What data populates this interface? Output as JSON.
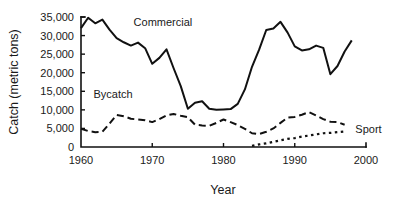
{
  "chart_data": {
    "type": "line",
    "title": "",
    "xlabel": "Year",
    "ylabel": "Catch (metric tons)",
    "xlim": [
      1960,
      2000
    ],
    "ylim": [
      0,
      35000
    ],
    "grid": false,
    "legend_position": "inline-annotations",
    "xticks": [
      1960,
      1970,
      1980,
      1990,
      2000
    ],
    "xtick_labels": [
      "1960",
      "1970",
      "1980",
      "1990",
      "2000"
    ],
    "yticks": [
      0,
      5000,
      10000,
      15000,
      20000,
      25000,
      30000,
      35000
    ],
    "ytick_labels": [
      "0",
      "5,000",
      "10,000",
      "15,000",
      "20,000",
      "25,000",
      "30,000",
      "35,000"
    ],
    "series": [
      {
        "name": "Commercial",
        "style": "solid",
        "color": "#111111",
        "label_x": 1971.5,
        "label_y": 32500,
        "x": [
          1960,
          1961,
          1962,
          1963,
          1964,
          1965,
          1966,
          1967,
          1968,
          1969,
          1970,
          1971,
          1972,
          1973,
          1974,
          1975,
          1976,
          1977,
          1978,
          1979,
          1980,
          1981,
          1982,
          1983,
          1984,
          1985,
          1986,
          1987,
          1988,
          1989,
          1990,
          1991,
          1992,
          1993,
          1994,
          1995,
          1996,
          1997,
          1998
        ],
        "values": [
          32000,
          34800,
          33300,
          34300,
          31600,
          29300,
          28200,
          27300,
          28100,
          26600,
          22400,
          24000,
          26300,
          21200,
          16400,
          10300,
          11900,
          12300,
          10300,
          10000,
          10100,
          10200,
          11600,
          15500,
          21600,
          26200,
          31500,
          31900,
          33700,
          30800,
          27100,
          26000,
          26300,
          27300,
          26700,
          19600,
          21800,
          25700,
          28700
        ]
      },
      {
        "name": "Bycatch",
        "style": "dashed",
        "color": "#111111",
        "label_x": 1964.5,
        "label_y": 13100,
        "x": [
          1960,
          1961,
          1962,
          1963,
          1964,
          1965,
          1966,
          1967,
          1968,
          1969,
          1970,
          1971,
          1972,
          1973,
          1974,
          1975,
          1976,
          1977,
          1978,
          1979,
          1980,
          1981,
          1982,
          1983,
          1984,
          1985,
          1986,
          1987,
          1988,
          1989,
          1990,
          1991,
          1992,
          1993,
          1994,
          1995,
          1996,
          1997
        ],
        "values": [
          4900,
          4300,
          4000,
          4100,
          6300,
          8600,
          8300,
          7600,
          7400,
          7200,
          6700,
          7500,
          8500,
          8900,
          8400,
          8000,
          6000,
          5800,
          5700,
          6500,
          7400,
          6700,
          5900,
          4900,
          3700,
          3500,
          4100,
          5000,
          6500,
          7900,
          8100,
          8700,
          9400,
          8500,
          7500,
          6800,
          6700,
          6000
        ]
      },
      {
        "name": "Sport",
        "style": "dotted",
        "color": "#111111",
        "label_x": 1998.5,
        "label_y": 3900,
        "x": [
          1984,
          1985,
          1986,
          1987,
          1988,
          1989,
          1990,
          1991,
          1992,
          1993,
          1994,
          1995,
          1996,
          1997
        ],
        "values": [
          300,
          700,
          1000,
          1400,
          1800,
          2200,
          2400,
          2800,
          3100,
          3400,
          3700,
          3800,
          4000,
          4200
        ]
      }
    ]
  },
  "axes": {
    "y_axis_title": "Catch (metric tons)",
    "x_axis_title": "Year"
  }
}
